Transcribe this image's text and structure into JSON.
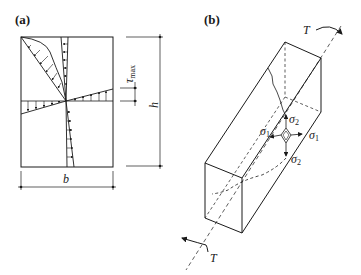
{
  "figure": {
    "panel_a": {
      "label": "(a)",
      "width_symbol": "b",
      "height_symbol": "h",
      "stress_symbol": "τ",
      "stress_subscript": "max"
    },
    "panel_b": {
      "label": "(b)",
      "torque_top": "T",
      "torque_bottom": "T",
      "sigma1_left": "σ",
      "sigma1_left_sub": "1",
      "sigma1_right": "σ",
      "sigma1_right_sub": "1",
      "sigma2_top": "σ",
      "sigma2_top_sub": "2",
      "sigma2_bottom": "σ",
      "sigma2_bottom_sub": "2"
    }
  },
  "colors": {
    "line": "#1a1a1a",
    "background": "#ffffff"
  }
}
